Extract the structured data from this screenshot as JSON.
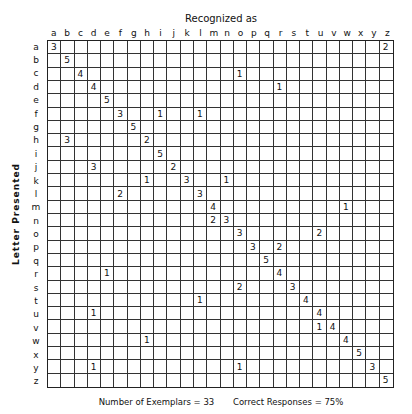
{
  "chart_data": {
    "type": "table",
    "title": "Recognized as",
    "xlabel": "Recognized as",
    "ylabel": "Letter Presented",
    "columns": [
      "a",
      "b",
      "c",
      "d",
      "e",
      "f",
      "g",
      "h",
      "i",
      "j",
      "k",
      "l",
      "m",
      "n",
      "o",
      "p",
      "q",
      "r",
      "s",
      "t",
      "u",
      "v",
      "w",
      "x",
      "y",
      "z"
    ],
    "rows": [
      "a",
      "b",
      "c",
      "d",
      "e",
      "f",
      "g",
      "h",
      "i",
      "j",
      "k",
      "l",
      "m",
      "n",
      "o",
      "p",
      "q",
      "r",
      "s",
      "t",
      "u",
      "v",
      "w",
      "x",
      "y",
      "z"
    ],
    "cells": [
      {
        "row": "a",
        "col": "a",
        "value": 3
      },
      {
        "row": "a",
        "col": "z",
        "value": 2
      },
      {
        "row": "b",
        "col": "b",
        "value": 5
      },
      {
        "row": "c",
        "col": "c",
        "value": 4
      },
      {
        "row": "c",
        "col": "o",
        "value": 1
      },
      {
        "row": "d",
        "col": "d",
        "value": 4
      },
      {
        "row": "d",
        "col": "r",
        "value": 1
      },
      {
        "row": "e",
        "col": "e",
        "value": 5
      },
      {
        "row": "f",
        "col": "f",
        "value": 3
      },
      {
        "row": "f",
        "col": "i",
        "value": 1
      },
      {
        "row": "f",
        "col": "l",
        "value": 1
      },
      {
        "row": "g",
        "col": "g",
        "value": 5
      },
      {
        "row": "h",
        "col": "b",
        "value": 3
      },
      {
        "row": "h",
        "col": "h",
        "value": 2
      },
      {
        "row": "i",
        "col": "i",
        "value": 5
      },
      {
        "row": "j",
        "col": "d",
        "value": 3
      },
      {
        "row": "j",
        "col": "j",
        "value": 2
      },
      {
        "row": "k",
        "col": "h",
        "value": 1
      },
      {
        "row": "k",
        "col": "k",
        "value": 3
      },
      {
        "row": "k",
        "col": "n",
        "value": 1
      },
      {
        "row": "l",
        "col": "f",
        "value": 2
      },
      {
        "row": "l",
        "col": "l",
        "value": 3
      },
      {
        "row": "m",
        "col": "m",
        "value": 4
      },
      {
        "row": "m",
        "col": "w",
        "value": 1
      },
      {
        "row": "n",
        "col": "m",
        "value": 2
      },
      {
        "row": "n",
        "col": "n",
        "value": 3
      },
      {
        "row": "o",
        "col": "o",
        "value": 3
      },
      {
        "row": "o",
        "col": "u",
        "value": 2
      },
      {
        "row": "p",
        "col": "p",
        "value": 3
      },
      {
        "row": "p",
        "col": "r",
        "value": 2
      },
      {
        "row": "q",
        "col": "q",
        "value": 5
      },
      {
        "row": "r",
        "col": "e",
        "value": 1
      },
      {
        "row": "r",
        "col": "r",
        "value": 4
      },
      {
        "row": "s",
        "col": "o",
        "value": 2
      },
      {
        "row": "s",
        "col": "s",
        "value": 3
      },
      {
        "row": "t",
        "col": "l",
        "value": 1
      },
      {
        "row": "t",
        "col": "t",
        "value": 4
      },
      {
        "row": "u",
        "col": "d",
        "value": 1
      },
      {
        "row": "u",
        "col": "u",
        "value": 4
      },
      {
        "row": "v",
        "col": "u",
        "value": 1
      },
      {
        "row": "v",
        "col": "v",
        "value": 4
      },
      {
        "row": "w",
        "col": "h",
        "value": 1
      },
      {
        "row": "w",
        "col": "w",
        "value": 4
      },
      {
        "row": "x",
        "col": "x",
        "value": 5
      },
      {
        "row": "y",
        "col": "d",
        "value": 1
      },
      {
        "row": "y",
        "col": "o",
        "value": 1
      },
      {
        "row": "y",
        "col": "y",
        "value": 3
      },
      {
        "row": "z",
        "col": "z",
        "value": 5
      }
    ],
    "grid": true
  },
  "header": {
    "title": "Recognized as"
  },
  "axis": {
    "y_label": "Letter Presented"
  },
  "footer": {
    "exemplars": "Number of Exemplars = 33",
    "correct": "Correct Responses = 75%"
  }
}
